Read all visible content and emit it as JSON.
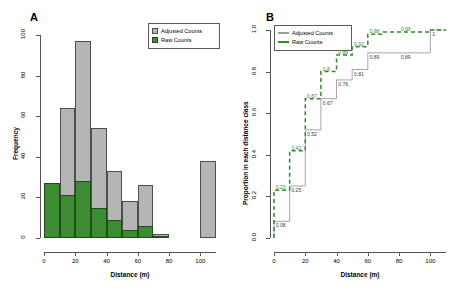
{
  "figure": {
    "panel_a_letter": "A",
    "panel_b_letter": "B"
  },
  "panelA": {
    "letter": "A",
    "xlabel": "Distance (m)",
    "ylabel": "Frequency",
    "xticks": [
      "0",
      "20",
      "40",
      "60",
      "80",
      "100"
    ],
    "yticks": [
      "0",
      "20",
      "40",
      "60",
      "80",
      "100"
    ],
    "legend": {
      "adjusted_label": "Adjusted Counts",
      "raw_label": "Raw Counts",
      "adjusted_color": "#b5b5b5",
      "raw_color": "#3d8b33"
    }
  },
  "panelB": {
    "letter": "B",
    "xlabel": "Distance (m)",
    "ylabel": "Proportion in each distance class",
    "xticks": [
      "0",
      "20",
      "40",
      "60",
      "80",
      "100"
    ],
    "yticks": [
      "0.0",
      "0.2",
      "0.4",
      "0.6",
      "0.8",
      "1.0"
    ],
    "legend": {
      "adjusted_label": "Adjusted Counts",
      "raw_label": "Raw Counts",
      "adjusted_color": "#9a9a9a",
      "raw_color": "#2f8a2a"
    }
  },
  "chart_data": [
    {
      "type": "bar",
      "id": "panel-a-histogram",
      "title": "A",
      "xlabel": "Distance (m)",
      "ylabel": "Frequency",
      "xlim": [
        0,
        110
      ],
      "ylim": [
        0,
        100
      ],
      "bin_width": 10,
      "bin_starts": [
        0,
        10,
        20,
        30,
        40,
        50,
        60,
        70,
        100
      ],
      "grid": false,
      "legend_position": "top-right",
      "series": [
        {
          "name": "Adjusted Counts",
          "color": "#b5b5b5",
          "values": [
            27,
            64,
            97,
            54,
            33,
            18,
            26,
            2,
            38
          ]
        },
        {
          "name": "Raw Counts",
          "color": "#3d8b33",
          "values": [
            27,
            21,
            28,
            15,
            9,
            4,
            6,
            1,
            0
          ]
        }
      ]
    },
    {
      "type": "line",
      "id": "panel-b-cumulative",
      "title": "B",
      "xlabel": "Distance (m)",
      "ylabel": "Proportion in each distance class",
      "xlim": [
        0,
        110
      ],
      "ylim": [
        0,
        1.0
      ],
      "grid": false,
      "legend_position": "top-left",
      "step": true,
      "x": [
        0,
        10,
        20,
        30,
        40,
        50,
        60,
        70,
        100,
        110
      ],
      "series": [
        {
          "name": "Adjusted Counts",
          "color": "#9a9a9a",
          "style": "solid-step",
          "values": [
            0.08,
            0.25,
            0.52,
            0.67,
            0.76,
            0.81,
            0.89,
            0.89,
            1.0,
            1.0
          ],
          "labels": [
            "0.08",
            "0.25",
            "0.52",
            "0.67",
            "0.76",
            "0.81",
            "0.89",
            "0.89",
            "1",
            ""
          ]
        },
        {
          "name": "Raw Counts",
          "color": "#2f8a2a",
          "style": "dashed-step",
          "values": [
            0.23,
            0.42,
            0.67,
            0.8,
            0.88,
            0.92,
            0.98,
            0.99,
            1.0,
            1.0
          ],
          "labels": [
            "0.23",
            "0.42",
            "0.67",
            "0.8",
            "0.88",
            "0.92",
            "0.98",
            "0.99",
            "",
            ""
          ]
        }
      ]
    }
  ]
}
